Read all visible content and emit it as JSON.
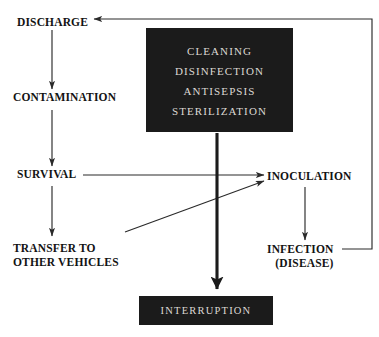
{
  "diagram": {
    "colors": {
      "background": "#ffffff",
      "text": "#131313",
      "box_fill": "#1b1b1b",
      "box_text": "#ddd9d4",
      "edge": "#2a2a2a"
    },
    "nodes": {
      "discharge": {
        "label": "DISCHARGE"
      },
      "contamination": {
        "label": "CONTAMINATION"
      },
      "survival": {
        "label": "SURVIVAL"
      },
      "transfer": {
        "line1": "TRANSFER TO",
        "line2": "OTHER VEHICLES"
      },
      "inoculation": {
        "label": "INOCULATION"
      },
      "infection": {
        "line1": "INFECTION",
        "line2": "(DISEASE)"
      }
    },
    "treatment_box": {
      "name": "treatment-methods-box",
      "lines": [
        "CLEANING",
        "DISINFECTION",
        "ANTISEPSIS",
        "STERILIZATION"
      ]
    },
    "interruption_box": {
      "name": "interruption-box",
      "label": "INTERRUPTION"
    },
    "edges": [
      {
        "id": "discharge-to-contamination",
        "from": "DISCHARGE",
        "to": "CONTAMINATION",
        "style": "thin-arrow"
      },
      {
        "id": "contamination-to-survival",
        "from": "CONTAMINATION",
        "to": "SURVIVAL",
        "style": "thin-arrow"
      },
      {
        "id": "survival-to-transfer",
        "from": "SURVIVAL",
        "to": "TRANSFER TO OTHER VEHICLES",
        "style": "thin-arrow"
      },
      {
        "id": "survival-to-inoculation",
        "from": "SURVIVAL",
        "to": "INOCULATION",
        "style": "thin-arrow"
      },
      {
        "id": "transfer-to-inoculation",
        "from": "TRANSFER TO OTHER VEHICLES",
        "to": "INOCULATION",
        "style": "thin-arrow-diagonal"
      },
      {
        "id": "inoculation-to-infection",
        "from": "INOCULATION",
        "to": "INFECTION (DISEASE)",
        "style": "thin-arrow"
      },
      {
        "id": "infection-to-discharge",
        "from": "INFECTION (DISEASE)",
        "to": "DISCHARGE",
        "style": "thin-arrow-feedback"
      },
      {
        "id": "treatment-to-interruption",
        "from": "CLEANING/DISINFECTION/ANTISEPSIS/STERILIZATION",
        "to": "INTERRUPTION",
        "style": "thick-arrow"
      }
    ]
  }
}
